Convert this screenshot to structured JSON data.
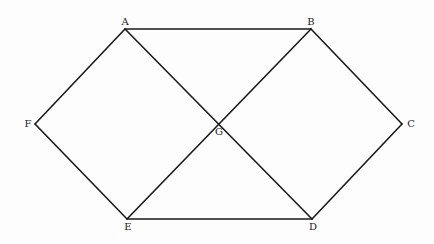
{
  "diagram": {
    "type": "geometric-figure",
    "vertices": [
      {
        "id": "A",
        "label": "A",
        "x": 125,
        "y": 29,
        "lx": 125,
        "ly": 22
      },
      {
        "id": "B",
        "label": "B",
        "x": 311,
        "y": 29,
        "lx": 311,
        "ly": 22
      },
      {
        "id": "C",
        "label": "C",
        "x": 402,
        "y": 124,
        "lx": 411,
        "ly": 124
      },
      {
        "id": "D",
        "label": "D",
        "x": 312,
        "y": 219,
        "lx": 313,
        "ly": 227
      },
      {
        "id": "E",
        "label": "E",
        "x": 127,
        "y": 219,
        "lx": 128,
        "ly": 227
      },
      {
        "id": "F",
        "label": "F",
        "x": 35,
        "y": 124,
        "lx": 28,
        "ly": 124
      },
      {
        "id": "G",
        "label": "G",
        "x": 219,
        "y": 124,
        "lx": 219,
        "ly": 132
      }
    ],
    "edges": [
      [
        "A",
        "B"
      ],
      [
        "B",
        "C"
      ],
      [
        "C",
        "D"
      ],
      [
        "D",
        "E"
      ],
      [
        "E",
        "F"
      ],
      [
        "F",
        "A"
      ],
      [
        "A",
        "D"
      ],
      [
        "B",
        "E"
      ]
    ],
    "stroke_color": "#1a1a1a"
  }
}
